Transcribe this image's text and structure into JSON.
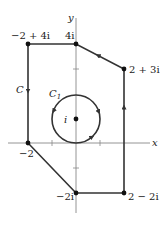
{
  "figure": {
    "type": "complex-plane-contour",
    "axes": {
      "x_label": "x",
      "y_label": "y",
      "tick_marks_x": [
        -1,
        1
      ],
      "tick_marks_y": [
        3,
        -1
      ],
      "colors": {
        "axis": "#888888",
        "contour": "#333333",
        "point": "#111111"
      }
    },
    "contour_C": {
      "label": "C",
      "orientation": "counterclockwise (arrow down on left side, up on right side, leftward on top-right edge)",
      "vertices": [
        {
          "label": "−2 + 4i",
          "re": -2,
          "im": 4
        },
        {
          "label": "4i",
          "re": 0,
          "im": 4
        },
        {
          "label": "2 + 3i",
          "re": 2,
          "im": 3
        },
        {
          "label": "2 − 2i",
          "re": 2,
          "im": -2
        },
        {
          "label": "−2i",
          "re": 0,
          "im": -2
        },
        {
          "label": "−2",
          "re": -2,
          "im": 0
        }
      ]
    },
    "circle_C1": {
      "label": "C",
      "subscript": "1",
      "center_label": "i",
      "center": {
        "re": 0,
        "im": 1
      },
      "radius": 1,
      "orientation": "counterclockwise"
    }
  }
}
